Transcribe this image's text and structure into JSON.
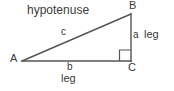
{
  "diagram": {
    "type": "right-triangle",
    "background_color": "#ffffff",
    "stroke_color": "#555555",
    "text_color": "#3a3a3a",
    "vertices": [
      {
        "name": "A",
        "label": "A",
        "x": 22,
        "y": 61
      },
      {
        "name": "B",
        "label": "B",
        "x": 131,
        "y": 14
      },
      {
        "name": "C",
        "label": "C",
        "x": 131,
        "y": 61
      }
    ],
    "sides": [
      {
        "name": "hypotenuse",
        "letter": "c",
        "word": "hypotenuse",
        "from": "A",
        "to": "B"
      },
      {
        "name": "vertical-leg",
        "letter": "a",
        "word": "leg",
        "from": "B",
        "to": "C"
      },
      {
        "name": "horizontal-leg",
        "letter": "b",
        "word": "leg",
        "from": "A",
        "to": "C"
      }
    ],
    "right_angle": {
      "at": "C",
      "size": 11
    },
    "labels": {
      "hypotenuse_word": "hypotenuse",
      "hypotenuse_letter": "c",
      "vertex_a": "A",
      "vertex_b": "B",
      "vertex_c": "C",
      "leg_a_letter": "a",
      "leg_a_word": "leg",
      "leg_b_letter": "b",
      "leg_b_word": "leg"
    }
  }
}
